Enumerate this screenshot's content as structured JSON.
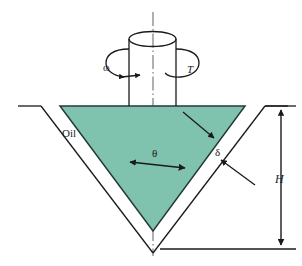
{
  "figure": {
    "colors": {
      "oil_fill": "#7FC2AD",
      "line": "#1a1a1a",
      "background": "#ffffff"
    },
    "labels": {
      "angular_velocity": "ω",
      "torque": "T",
      "fluid": "Oil",
      "cone_half_angle": "θ",
      "gap_thickness": "δ",
      "height": "H"
    },
    "elements": {
      "centerline": "vertical-axis-of-rotation",
      "shaft": "rotating-cylindrical-shaft",
      "shaft_top": "shaft-top-ellipse",
      "cone": "oil-filled-cone",
      "container": "outer-conical-container",
      "rotation_arrow_left": "counterclockwise-rotation-arrow",
      "rotation_arrow_right": "torque-rotation-arrow",
      "gap_pointer": "gap-leader-arrow",
      "surface_pointer": "cone-surface-leader-arrow",
      "theta_arrow": "cone-half-angle-double-arrow",
      "height_arrow": "height-dimension-double-arrow"
    }
  }
}
